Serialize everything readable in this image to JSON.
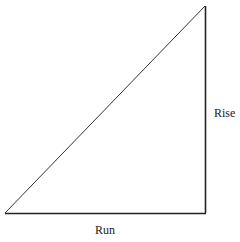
{
  "diagram": {
    "type": "right-triangle",
    "labels": {
      "rise": "Rise",
      "run": "Run"
    },
    "colors": {
      "stroke": "#222222",
      "background": "#ffffff"
    }
  }
}
